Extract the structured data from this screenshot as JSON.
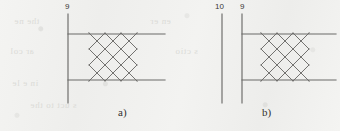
{
  "figure": {
    "background_color": "#f2f2f0",
    "line_color": "#6b6a68",
    "text_color": "#33312f",
    "ghost_text": [
      "the ne",
      "en er",
      "ar col",
      "s ctio",
      "in e le",
      "s uct to the"
    ],
    "panels": [
      {
        "id": "a",
        "caption": "a)",
        "caption_x": 118,
        "caption_y": 108,
        "leaders": [
          {
            "label": "9",
            "label_x": 65,
            "label_y": 3,
            "line_x": 68,
            "line_y1": 14,
            "line_y2": 103
          }
        ],
        "plates": [
          {
            "name": "upper-plate-line",
            "x1": 68,
            "y1": 34,
            "x2": 165,
            "y2": 34
          },
          {
            "name": "lower-plate-line",
            "x1": 68,
            "y1": 80,
            "x2": 165,
            "y2": 80
          }
        ],
        "lattice": {
          "name": "diamond-lattice",
          "center_x": 113,
          "center_y": 57,
          "half_diagonal": 24,
          "divisions": 3
        }
      },
      {
        "id": "b",
        "caption": "b)",
        "caption_x": 262,
        "caption_y": 108,
        "leaders": [
          {
            "label": "10",
            "label_x": 216,
            "label_y": 3,
            "line_x": 222,
            "line_y1": 14,
            "line_y2": 103
          },
          {
            "label": "9",
            "label_x": 240,
            "label_y": 3,
            "line_x": 242,
            "line_y1": 14,
            "line_y2": 103
          }
        ],
        "plates": [
          {
            "name": "upper-plate-line",
            "x1": 242,
            "y1": 34,
            "x2": 336,
            "y2": 34
          },
          {
            "name": "lower-plate-line",
            "x1": 242,
            "y1": 80,
            "x2": 336,
            "y2": 80
          }
        ],
        "lattice": {
          "name": "diamond-lattice",
          "center_x": 285,
          "center_y": 57,
          "half_diagonal": 24,
          "divisions": 3
        }
      }
    ]
  }
}
